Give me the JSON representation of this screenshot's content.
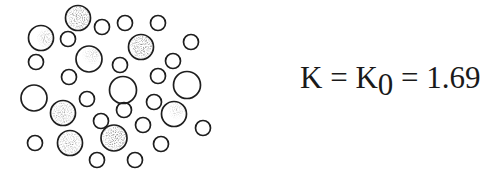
{
  "equation": {
    "lhs": "K",
    "eq1": " = ",
    "k0_base": "K",
    "k0_sub": "0",
    "eq2": " = ",
    "value": "1.69"
  },
  "diagram": {
    "stroke_color": "#1e1e1e",
    "shade_color": "#333333",
    "circles": [
      {
        "cx": 78,
        "cy": 18,
        "r": 12.5,
        "shade": "dark"
      },
      {
        "cx": 41,
        "cy": 38,
        "r": 12.5,
        "shade": "partial"
      },
      {
        "cx": 68,
        "cy": 39,
        "r": 7.5,
        "shade": "none"
      },
      {
        "cx": 102,
        "cy": 27,
        "r": 7.5,
        "shade": "none"
      },
      {
        "cx": 125,
        "cy": 23,
        "r": 7.5,
        "shade": "none"
      },
      {
        "cx": 158,
        "cy": 23,
        "r": 7.5,
        "shade": "none"
      },
      {
        "cx": 141,
        "cy": 47,
        "r": 12.5,
        "shade": "dark"
      },
      {
        "cx": 191,
        "cy": 42,
        "r": 7.5,
        "shade": "none"
      },
      {
        "cx": 36,
        "cy": 62,
        "r": 7.5,
        "shade": "none"
      },
      {
        "cx": 89,
        "cy": 59,
        "r": 13,
        "shade": "light"
      },
      {
        "cx": 120,
        "cy": 65,
        "r": 7.5,
        "shade": "none"
      },
      {
        "cx": 173,
        "cy": 61,
        "r": 7.5,
        "shade": "none"
      },
      {
        "cx": 69,
        "cy": 77,
        "r": 7.5,
        "shade": "none"
      },
      {
        "cx": 158,
        "cy": 76,
        "r": 7.5,
        "shade": "none"
      },
      {
        "cx": 187,
        "cy": 85,
        "r": 13.5,
        "shade": "none"
      },
      {
        "cx": 123,
        "cy": 90,
        "r": 13.5,
        "shade": "none"
      },
      {
        "cx": 34,
        "cy": 98,
        "r": 13,
        "shade": "none"
      },
      {
        "cx": 87,
        "cy": 99,
        "r": 7.5,
        "shade": "none"
      },
      {
        "cx": 63,
        "cy": 113,
        "r": 12.5,
        "shade": "medium"
      },
      {
        "cx": 124,
        "cy": 110,
        "r": 7.5,
        "shade": "none"
      },
      {
        "cx": 154,
        "cy": 102,
        "r": 7.5,
        "shade": "none"
      },
      {
        "cx": 174,
        "cy": 114,
        "r": 12.5,
        "shade": "light"
      },
      {
        "cx": 101,
        "cy": 121,
        "r": 7.5,
        "shade": "none"
      },
      {
        "cx": 143,
        "cy": 125,
        "r": 7.5,
        "shade": "none"
      },
      {
        "cx": 203,
        "cy": 128,
        "r": 7.5,
        "shade": "none"
      },
      {
        "cx": 70,
        "cy": 143,
        "r": 12.5,
        "shade": "medium"
      },
      {
        "cx": 114,
        "cy": 138,
        "r": 13,
        "shade": "dark"
      },
      {
        "cx": 35,
        "cy": 143,
        "r": 7.5,
        "shade": "none"
      },
      {
        "cx": 161,
        "cy": 144,
        "r": 7.5,
        "shade": "none"
      },
      {
        "cx": 97,
        "cy": 160,
        "r": 7.5,
        "shade": "none"
      },
      {
        "cx": 135,
        "cy": 160,
        "r": 7.5,
        "shade": "none"
      }
    ]
  }
}
